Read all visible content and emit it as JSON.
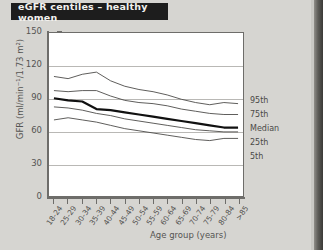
{
  "title": "eGFR centiles – healthy women",
  "colors": {
    "background": "#d6d5d1",
    "plot_background": "#ffffff",
    "banner_background": "#1d1d1d",
    "banner_text": "#f2f1ee",
    "axis": "#6e6d6a",
    "gridline": "#b9b8b5",
    "curve": "#4a4947",
    "median_curve": "#111111",
    "text": "#555452"
  },
  "axes": {
    "x_title": "Age group (years)",
    "y_title": "GFR (ml/min⁻¹/1.73 m²)",
    "y_ticks": [
      "150",
      "120",
      "90",
      "60",
      "30",
      "0"
    ],
    "y_min": 0,
    "y_max": 150
  },
  "legend": {
    "items": [
      {
        "label": "95th"
      },
      {
        "label": "75th"
      },
      {
        "label": "Median"
      },
      {
        "label": "25th"
      },
      {
        "label": "5th"
      }
    ]
  },
  "chart_data": {
    "type": "line",
    "title": "eGFR centiles – healthy women",
    "xlabel": "Age group (years)",
    "ylabel": "GFR (ml/min⁻¹/1.73 m²)",
    "ylim": [
      0,
      150
    ],
    "yticks": [
      0,
      30,
      60,
      90,
      120,
      150
    ],
    "grid": true,
    "legend_position": "right",
    "categories": [
      "18-24",
      "25-29",
      "30-34",
      "35-39",
      "40-44",
      "45-49",
      "50-54",
      "55-59",
      "60-64",
      "65-69",
      "70-74",
      "75-79",
      "80-84",
      ">85"
    ],
    "series": [
      {
        "name": "95th",
        "values": [
          110,
          108,
          112,
          114,
          106,
          101,
          98,
          96,
          93,
          89,
          86,
          84,
          86,
          85
        ]
      },
      {
        "name": "75th",
        "values": [
          97,
          96,
          97,
          97,
          92,
          88,
          86,
          85,
          83,
          80,
          78,
          76,
          75,
          75
        ]
      },
      {
        "name": "Median",
        "values": [
          90,
          88,
          87,
          80,
          79,
          77,
          75,
          73,
          71,
          69,
          67,
          65,
          63,
          63
        ]
      },
      {
        "name": "25th",
        "values": [
          82,
          81,
          79,
          76,
          74,
          71,
          69,
          67,
          65,
          63,
          61,
          60,
          59,
          59
        ]
      },
      {
        "name": "5th",
        "values": [
          70,
          72,
          70,
          68,
          65,
          62,
          60,
          58,
          56,
          54,
          52,
          51,
          53,
          53
        ]
      }
    ]
  }
}
